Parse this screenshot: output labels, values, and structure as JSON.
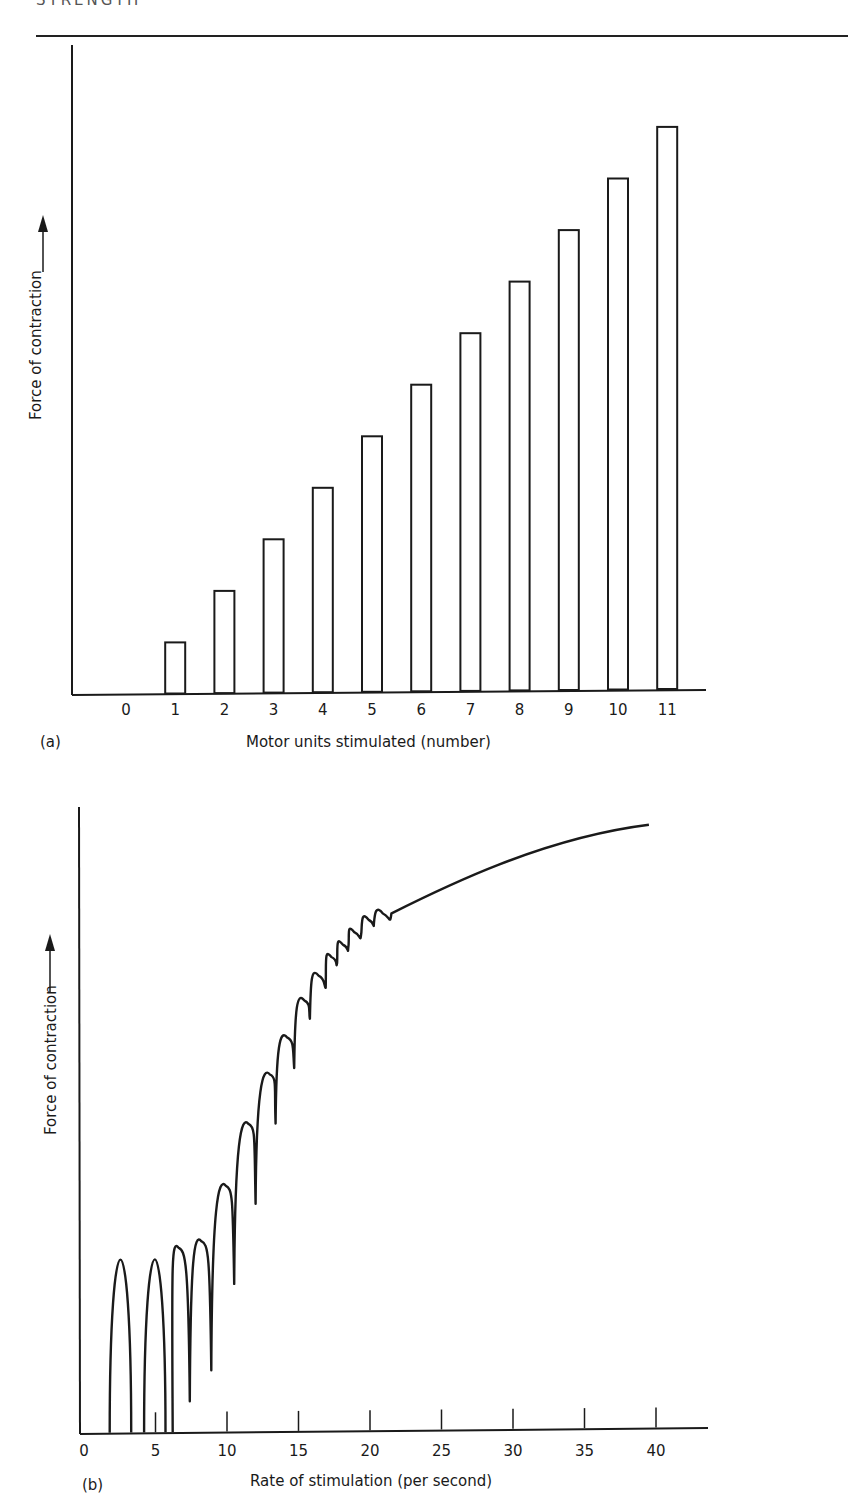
{
  "page": {
    "running_head": "STRENGTH"
  },
  "chart_data": [
    {
      "id": "a",
      "panel_label": "(a)",
      "type": "bar",
      "title": "",
      "xlabel": "Motor units stimulated (number)",
      "ylabel": "Force of contraction",
      "ylabel_arrow": "up-arrow",
      "categories": [
        "0",
        "1",
        "2",
        "3",
        "4",
        "5",
        "6",
        "7",
        "8",
        "9",
        "10",
        "11"
      ],
      "values": [
        0,
        1,
        2,
        3,
        4,
        5,
        6,
        7,
        8,
        9,
        10,
        11
      ],
      "value_units": "relative force (arbitrary units, no y tick labels)",
      "ylim": [
        0,
        12
      ],
      "grid": false,
      "legend": null,
      "bar_style": "outlined, white fill"
    },
    {
      "id": "b",
      "panel_label": "(b)",
      "type": "line",
      "title": "",
      "xlabel": "Rate of stimulation (per second)",
      "ylabel": "Force of contraction",
      "ylabel_arrow": "up-arrow",
      "x_ticks": [
        0,
        5,
        10,
        15,
        20,
        25,
        30,
        35,
        40
      ],
      "xlim": [
        0,
        43
      ],
      "ylim": [
        0,
        100
      ],
      "grid": false,
      "legend": null,
      "description": "Individual twitches at low rates (separate humps returning to baseline), summation with ripple between ~7 and ~22 per second, then smooth tetanic curve plateauing near 40 per second",
      "series": [
        {
          "name": "Force envelope (peaks)",
          "x": [
            2.5,
            5,
            6.5,
            8.2,
            9.9,
            11.5,
            13.2,
            14.7,
            16.0,
            17.0,
            17.9,
            18.6,
            19.5,
            20.4,
            21.5,
            25,
            30,
            35,
            39.5
          ],
          "y": [
            30,
            30,
            30,
            31,
            40,
            50,
            58,
            64,
            70,
            74,
            77,
            79,
            81,
            83,
            84,
            88,
            93,
            97,
            98
          ]
        },
        {
          "name": "Force troughs (between twitches)",
          "x": [
            3,
            4.2,
            5.7,
            7.4,
            8.9,
            10.5,
            12.0,
            13.4,
            14.7,
            15.8,
            16.9,
            17.7,
            18.5,
            19.4,
            20.3
          ],
          "y": [
            0,
            0,
            0,
            5,
            10,
            24,
            37,
            50,
            59,
            67,
            72,
            76,
            79,
            81,
            83
          ]
        }
      ]
    }
  ]
}
